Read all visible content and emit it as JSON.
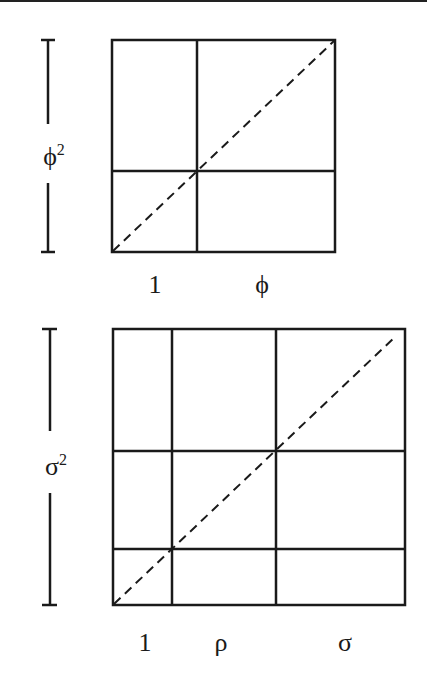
{
  "figure": {
    "top": {
      "side_label": "ϕ",
      "side_label_exp": "2",
      "bottom_labels": [
        "1",
        "ϕ"
      ]
    },
    "bottom": {
      "side_label": "σ",
      "side_label_exp": "2",
      "bottom_labels": [
        "1",
        "ρ",
        "σ"
      ]
    }
  }
}
